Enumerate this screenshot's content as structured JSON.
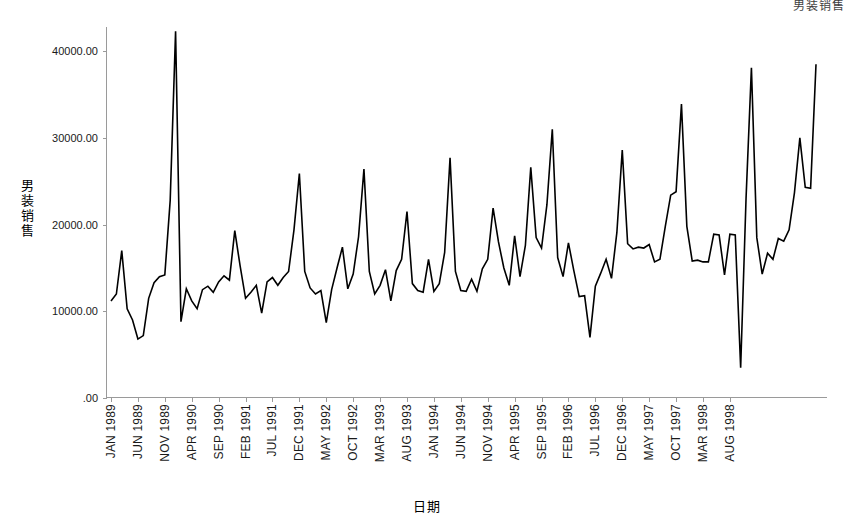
{
  "corner_title": "男装销售",
  "chart_data": {
    "type": "line",
    "title": "男装销售",
    "xlabel": "日期",
    "ylabel": "男装销售",
    "ylim": [
      0,
      45000
    ],
    "grid": false,
    "legend": "none",
    "y_ticks": [
      {
        "value": 40000,
        "label": "40000.00"
      },
      {
        "value": 30000,
        "label": "30000.00"
      },
      {
        "value": 20000,
        "label": "20000.00"
      },
      {
        "value": 10000,
        "label": "10000.00"
      },
      {
        "value": 0,
        "label": ".00"
      }
    ],
    "x_tick_labels": [
      "JAN 1989",
      "JUN 1989",
      "NOV 1989",
      "APR 1990",
      "SEP 1990",
      "FEB 1991",
      "JUL 1991",
      "DEC 1991",
      "MAY 1992",
      "OCT 1992",
      "MAR 1993",
      "AUG 1993",
      "JAN 1994",
      "JUN 1994",
      "NOV 1994",
      "APR 1995",
      "SEP 1995",
      "FEB 1996",
      "JUL 1996",
      "DEC 1996",
      "MAY 1997",
      "OCT 1997",
      "MAR 1998",
      "AUG 1998"
    ],
    "x_tick_interval_months": 5,
    "x_start": "JAN 1989",
    "series_name": "男装销售",
    "values": [
      11200,
      12000,
      17000,
      10300,
      9000,
      6800,
      7200,
      11500,
      13300,
      14000,
      14200,
      22800,
      42300,
      8800,
      12600,
      11200,
      10300,
      12500,
      12900,
      12200,
      13400,
      14100,
      13600,
      19300,
      15200,
      11500,
      12200,
      13000,
      9800,
      13400,
      13900,
      13000,
      13900,
      14600,
      19400,
      25900,
      14600,
      12700,
      12000,
      12400,
      8700,
      12500,
      15000,
      17400,
      12600,
      14300,
      18600,
      26400,
      14600,
      12000,
      13000,
      14800,
      11200,
      14700,
      16000,
      21500,
      13200,
      12400,
      12200,
      16000,
      12300,
      13200,
      16800,
      27700,
      14600,
      12400,
      12300,
      13700,
      12300,
      14900,
      16000,
      21900,
      18000,
      15000,
      13000,
      18700,
      14000,
      17600,
      26600,
      18500,
      17300,
      22300,
      31000,
      16200,
      14000,
      17900,
      14700,
      11700,
      11800,
      7000,
      12900,
      14400,
      16000,
      13800,
      19100,
      28600,
      17800,
      17200,
      17400,
      17300,
      17700,
      15700,
      16000,
      19800,
      23400,
      23800,
      33900,
      19800,
      15800,
      15900,
      15700,
      15700,
      18900,
      18800,
      14200,
      18900,
      18800,
      3500,
      23000,
      38100,
      18500,
      14300,
      16700,
      16000,
      18400,
      18100,
      19400,
      23700,
      30000,
      24300,
      24200,
      38500
    ],
    "annotations": [
      {
        "type": "outlier-high",
        "approx_date": "JAN 1990",
        "value": 42300
      },
      {
        "type": "outlier-low",
        "approx_date": "OCT 1997",
        "value": 3500
      },
      {
        "type": "seasonal-peak",
        "note": "December peaks each year"
      }
    ]
  }
}
